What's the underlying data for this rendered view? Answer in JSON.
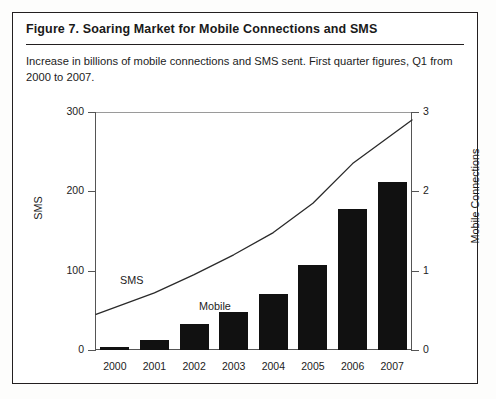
{
  "figure": {
    "title": "Figure 7.  Soaring Market for Mobile Connections and SMS",
    "subtitle": "Increase in billions of mobile connections and SMS sent. First quarter figures, Q1 from 2000 to 2007."
  },
  "chart_data": {
    "type": "bar",
    "title": "Soaring Market for Mobile Connections and SMS",
    "xlabel": "",
    "ylabel": "SMS",
    "y2label": "Mobile Connections",
    "categories": [
      "2000",
      "2001",
      "2002",
      "2003",
      "2004",
      "2005",
      "2006",
      "2007"
    ],
    "ylim": [
      0,
      300
    ],
    "yticks": [
      0,
      100,
      200,
      300
    ],
    "y2lim": [
      0,
      3
    ],
    "y2ticks": [
      0,
      1,
      2,
      3
    ],
    "grid": false,
    "legend": "inline-annotations",
    "series": [
      {
        "name": "SMS",
        "type": "bar",
        "axis": "left",
        "units": "billions",
        "values": [
          4,
          12,
          33,
          48,
          70,
          107,
          178,
          212
        ]
      },
      {
        "name": "Mobile",
        "type": "line",
        "axis": "right",
        "units": "billions",
        "values": [
          0.45,
          0.72,
          0.95,
          1.2,
          1.48,
          1.85,
          2.35,
          2.9
        ]
      }
    ],
    "annotations": [
      {
        "text": "SMS",
        "series": "SMS"
      },
      {
        "text": "Mobile",
        "series": "Mobile"
      }
    ]
  },
  "colors": {
    "bar": "#111111",
    "line": "#2a2a2a",
    "axis": "#555555",
    "border": "#231f20",
    "background": "#ffffff"
  }
}
